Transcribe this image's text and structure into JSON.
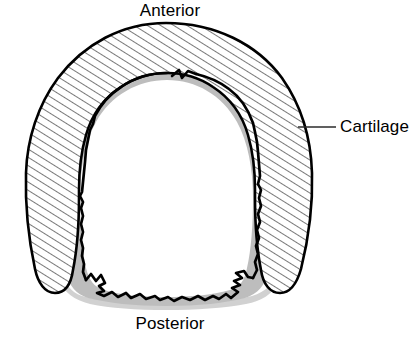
{
  "figure": {
    "labels": {
      "anterior": "Anterior",
      "posterior": "Posterior",
      "cartilage": "Cartilage"
    },
    "colors": {
      "ink": "#000000",
      "background": "#ffffff",
      "hatch": "#1a1a1a",
      "mucosa_gray": "#b8b8b8",
      "shadow_gray": "#c4c4c4",
      "leader": "#2b2b2b"
    },
    "structures": [
      {
        "name": "cartilage-ring",
        "label": "Cartilage",
        "fill": "hatched",
        "description": "C-shaped hyaline cartilage ring, open posteriorly"
      },
      {
        "name": "mucosa-lining",
        "label": "",
        "fill": "gray",
        "description": "Gray mucosal lining band inside the cartilage"
      },
      {
        "name": "lumen",
        "label": "",
        "fill": "white",
        "description": "Open airway lumen"
      },
      {
        "name": "posterior-membrane",
        "label": "Posterior",
        "fill": "none",
        "description": "Jagged trachealis membrane closing the ring posteriorly"
      }
    ],
    "leader_line": {
      "name": "cartilage-leader",
      "from": [
        300,
        127
      ],
      "to": [
        336,
        127
      ]
    }
  }
}
